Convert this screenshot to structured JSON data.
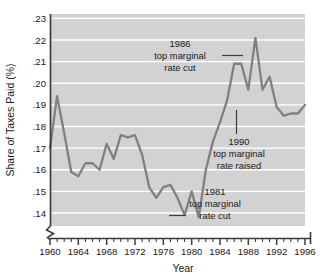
{
  "chart_data": {
    "type": "line",
    "title": "",
    "xlabel": "Year",
    "ylabel": "Share of Taxes Paid (%)",
    "xlim": [
      1960,
      1996
    ],
    "ylim": [
      0.134,
      0.232
    ],
    "grid": true,
    "grid_axis": "y",
    "legend_position": "none",
    "axis_break": true,
    "x_tick_labels": [
      "1960",
      "1964",
      "1968",
      "1972",
      "1976",
      "1980",
      "1984",
      "1988",
      "1992",
      "1996"
    ],
    "x_tick_values": [
      1960,
      1964,
      1968,
      1972,
      1976,
      1980,
      1984,
      1988,
      1992,
      1996
    ],
    "x_minor_tick_interval": 1,
    "y_tick_labels": [
      ".14",
      ".15",
      ".16",
      ".17",
      ".18",
      ".19",
      ".20",
      ".21",
      ".22",
      ".23"
    ],
    "y_tick_values": [
      0.14,
      0.15,
      0.16,
      0.17,
      0.18,
      0.19,
      0.2,
      0.21,
      0.22,
      0.23
    ],
    "series": [
      {
        "name": "Share of Taxes Paid",
        "color": "#808080",
        "x": [
          1960,
          1961,
          1962,
          1963,
          1964,
          1965,
          1966,
          1967,
          1968,
          1969,
          1970,
          1971,
          1972,
          1973,
          1974,
          1975,
          1976,
          1977,
          1978,
          1979,
          1980,
          1981,
          1982,
          1983,
          1984,
          1985,
          1986,
          1987,
          1988,
          1989,
          1990,
          1991,
          1992,
          1993,
          1994,
          1995,
          1996
        ],
        "y": [
          0.17,
          0.194,
          0.177,
          0.159,
          0.157,
          0.163,
          0.163,
          0.16,
          0.172,
          0.165,
          0.176,
          0.175,
          0.176,
          0.167,
          0.152,
          0.147,
          0.152,
          0.153,
          0.147,
          0.139,
          0.15,
          0.138,
          0.16,
          0.173,
          0.182,
          0.192,
          0.209,
          0.209,
          0.197,
          0.221,
          0.197,
          0.203,
          0.189,
          0.185,
          0.186,
          0.186,
          0.19
        ]
      }
    ],
    "annotations": [
      {
        "id": "1986-rate-cut",
        "line1": "1986",
        "line2": "top marginal",
        "line3": "rate cut",
        "leader": "right",
        "target_year": 1986,
        "target_value": 0.209
      },
      {
        "id": "1990-rate-raised",
        "line1": "1990",
        "line2": "top marginal",
        "line3": "rate raised",
        "leader": "up",
        "target_year": 1990,
        "target_value": 0.197
      },
      {
        "id": "1981-rate-cut",
        "line1": "1981",
        "line2": "top marginal",
        "line3": "rate cut",
        "leader": "left",
        "target_year": 1981,
        "target_value": 0.138
      }
    ],
    "colors": {
      "plot_background": "#d2d2d2",
      "gridline": "#ffffff",
      "line": "#808080",
      "axis": "#3c3c3c",
      "text": "#1a1a1a",
      "page_background": "#ffffff"
    }
  }
}
